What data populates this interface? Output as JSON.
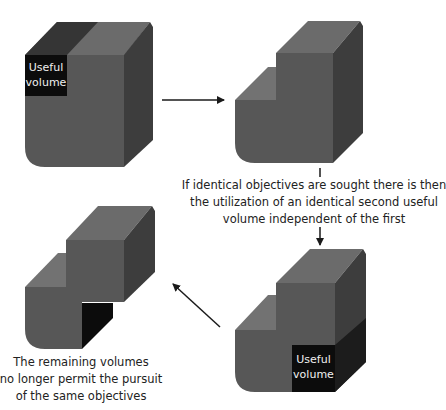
{
  "diagram": {
    "type": "process-cycle",
    "colors": {
      "top_face": "#6b6b6b",
      "front_face": "#575757",
      "right_face": "#3d3d3d",
      "dark_top": "#353535",
      "useful_volume": "#0c0c0c",
      "arrow": "#1a1a1a",
      "text": "#222222"
    },
    "nodes": [
      {
        "id": "block-1",
        "label": "Useful volume",
        "description": "Full block with useful volume marked at top-left corner"
      },
      {
        "id": "block-2",
        "label": "",
        "description": "Block with upper-left corner removed"
      },
      {
        "id": "block-3",
        "label": "Useful volume",
        "description": "Stepped block with second useful volume marked at bottom-right"
      },
      {
        "id": "block-4",
        "label": "",
        "description": "Remaining volumes after both useful volumes removed"
      }
    ],
    "edges": [
      {
        "from": "block-1",
        "to": "block-2"
      },
      {
        "from": "block-2",
        "to": "block-3"
      },
      {
        "from": "block-3",
        "to": "block-4"
      }
    ]
  },
  "labels": {
    "useful_volume_1": {
      "line1": "Useful",
      "line2": "volume"
    },
    "useful_volume_2": {
      "line1": "Useful",
      "line2": "volume"
    },
    "identical_objectives": {
      "line1": "If identical objectives are sought there is then",
      "line2": "the utilization of an identical second useful",
      "line3": "volume independent of the first"
    },
    "remaining_volumes": {
      "line1": "The remaining volumes",
      "line2": "no longer permit the pursuit",
      "line3": "of the same objectives"
    }
  }
}
